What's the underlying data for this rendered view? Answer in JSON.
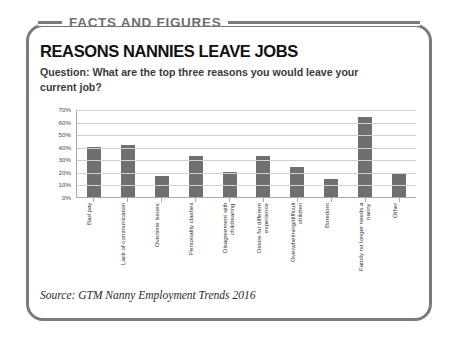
{
  "banner": {
    "title": "FACTS AND FIGURES"
  },
  "card": {
    "headline": "REASONS NANNIES LEAVE JOBS",
    "question": "Question: What are the top three reasons you would leave your current job?",
    "source": "Source: GTM Nanny Employment Trends 2016"
  },
  "colors": {
    "border": "#7b7b7b",
    "banner_text": "#6f6f6f",
    "headline": "#111111",
    "bar": "#6f6f6f",
    "gridline": "#d0d0d0",
    "axis": "#a8a8a8"
  },
  "chart_data": {
    "type": "bar",
    "title": "REASONS NANNIES LEAVE JOBS",
    "subtitle": "Question: What are the top three reasons you would leave your current job?",
    "xlabel": "",
    "ylabel": "",
    "ylim": [
      0,
      70
    ],
    "ytick_step": 10,
    "ytick_labels": [
      "0%",
      "10%",
      "20%",
      "30%",
      "40%",
      "50%",
      "60%",
      "70%"
    ],
    "grid": true,
    "legend": false,
    "value_suffix": "%",
    "categories": [
      "Bad pay",
      "Lack of communication",
      "Overtime issues",
      "Personality clashes",
      "Disagreement with childrearing",
      "Desire for different experience",
      "Overwhelming/difficult children",
      "Boredom",
      "Family no longer needs a nanny",
      "Other"
    ],
    "values": [
      40,
      41,
      17,
      33,
      20,
      33,
      24,
      14,
      64,
      18
    ]
  }
}
